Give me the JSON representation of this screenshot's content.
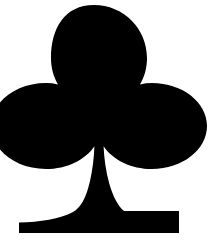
{
  "image": {
    "kind": "silhouette-graphic",
    "subject": "club-suit-symbol",
    "alt_text": "Black club suit symbol",
    "title": "Club",
    "unicode_glyph": "♣",
    "width_px": 224,
    "height_px": 245,
    "background_color": "#FFFFFF",
    "foreground_color": "#000000",
    "stroke": "none",
    "cropped_edges": "left"
  },
  "shape": {
    "description": "Three overlapping circular lobes above a flared triangular stem and a wide flat base",
    "parts": [
      {
        "name": "top-lobe",
        "center_x": 94,
        "center_y": 58,
        "radius": 53
      },
      {
        "name": "left-lobe",
        "center_x": 42,
        "center_y": 126,
        "radius": 55
      },
      {
        "name": "right-lobe",
        "center_x": 152,
        "center_y": 126,
        "radius": 55
      },
      {
        "name": "stem",
        "apex_x": 94,
        "apex_y": 126,
        "base_y": 222
      },
      {
        "name": "base",
        "left_x": 19,
        "right_x": 179,
        "top_y": 211,
        "bottom_y": 233
      }
    ],
    "path": "M 94 5 C 123.5 5 147 28.5 147 58 C 147 68 144.4 77 140 84.5 C 144 83.6 148 83.1 152 83.1 C 182.4 83.1 207 102.4 207 126 C 207 149.6 182.4 169 152 169 C 131 169 112.8 159.8 103.6 146.2 C 104 158 106 172 109.4 184 C 113 196.6 118 206 124 211 L 179 211 L 179 233 L 19 233 L 19 222.5 C 40 222 60 219 73 212 C 81.5 207.4 86.5 196 89.8 182 C 92.6 170 94 157.6 94.4 146.2 C 85.2 159.8 67 169 46 169 C 15.6 169 -9 149.6 -9 126 C -9 102.4 15.6 83.1 46 83.1 C 50 83.1 54 83.6 58 84.5 C 53.6 77 51 68 51 58 C 51 28.5 64.5 5 94 5 Z"
  }
}
